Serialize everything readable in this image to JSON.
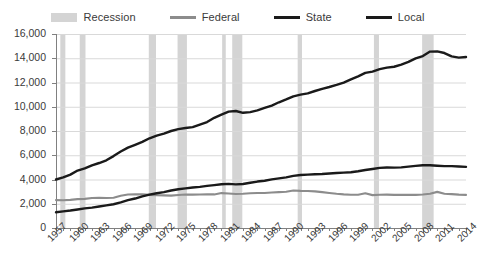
{
  "chart_data": {
    "type": "line",
    "title": "",
    "subtitle": "",
    "xlabel": "",
    "ylabel": "",
    "grid": true,
    "legend_position": "top-center",
    "units_note": "thousands of employees",
    "xlim": [
      1957,
      2014
    ],
    "ylim": [
      0,
      16000
    ],
    "ytick_step": 2000,
    "ytick_labels": [
      "16,000",
      "14,000",
      "12,000",
      "10,000",
      "8,000",
      "6,000",
      "4,000",
      "2,000",
      "0"
    ],
    "ytick_values": [
      16000,
      14000,
      12000,
      10000,
      8000,
      6000,
      4000,
      2000,
      0
    ],
    "xtick_labels": [
      "1957",
      "1960",
      "1963",
      "1966",
      "1969",
      "1972",
      "1975",
      "1978",
      "1981",
      "1984",
      "1987",
      "1990",
      "1993",
      "1996",
      "1999",
      "2002",
      "2005",
      "2008",
      "2011",
      "2014"
    ],
    "xtick_values": [
      1957,
      1960,
      1963,
      1966,
      1969,
      1972,
      1975,
      1978,
      1981,
      1984,
      1987,
      1990,
      1993,
      1996,
      1999,
      2002,
      2005,
      2008,
      2011,
      2014
    ],
    "x": [
      1957,
      1958,
      1959,
      1960,
      1961,
      1962,
      1963,
      1964,
      1965,
      1966,
      1967,
      1968,
      1969,
      1970,
      1971,
      1972,
      1973,
      1974,
      1975,
      1976,
      1977,
      1978,
      1979,
      1980,
      1981,
      1982,
      1983,
      1984,
      1985,
      1986,
      1987,
      1988,
      1989,
      1990,
      1991,
      1992,
      1993,
      1994,
      1995,
      1996,
      1997,
      1998,
      1999,
      2000,
      2001,
      2002,
      2003,
      2004,
      2005,
      2006,
      2007,
      2008,
      2009,
      2010,
      2011,
      2012,
      2013,
      2014
    ],
    "series": [
      {
        "name": "Federal",
        "color": "#8c8c8c",
        "values": [
          2300,
          2290,
          2320,
          2380,
          2400,
          2480,
          2490,
          2470,
          2500,
          2660,
          2760,
          2780,
          2770,
          2730,
          2700,
          2690,
          2670,
          2720,
          2760,
          2750,
          2760,
          2770,
          2770,
          2880,
          2840,
          2800,
          2820,
          2860,
          2890,
          2890,
          2930,
          2960,
          2990,
          3090,
          3060,
          3050,
          3020,
          2960,
          2890,
          2820,
          2770,
          2740,
          2740,
          2860,
          2710,
          2740,
          2750,
          2730,
          2730,
          2730,
          2730,
          2760,
          2830,
          2980,
          2820,
          2790,
          2750,
          2730
        ]
      },
      {
        "name": "State",
        "color": "#1a1a1a",
        "values": [
          1300,
          1370,
          1440,
          1530,
          1620,
          1680,
          1770,
          1870,
          1960,
          2120,
          2300,
          2430,
          2610,
          2750,
          2870,
          2960,
          3090,
          3200,
          3270,
          3340,
          3390,
          3470,
          3540,
          3610,
          3640,
          3600,
          3630,
          3730,
          3830,
          3900,
          4010,
          4090,
          4180,
          4300,
          4370,
          4400,
          4430,
          4450,
          4500,
          4540,
          4570,
          4600,
          4680,
          4780,
          4870,
          4960,
          4990,
          4980,
          5000,
          5060,
          5120,
          5180,
          5170,
          5130,
          5100,
          5100,
          5070,
          5040
        ]
      },
      {
        "name": "Local",
        "color": "#1a1a1a",
        "values": [
          4000,
          4170,
          4400,
          4740,
          4920,
          5170,
          5360,
          5580,
          5930,
          6310,
          6630,
          6860,
          7100,
          7400,
          7620,
          7790,
          8000,
          8150,
          8250,
          8320,
          8530,
          8740,
          9090,
          9350,
          9600,
          9650,
          9500,
          9560,
          9700,
          9900,
          10100,
          10370,
          10600,
          10860,
          11000,
          11100,
          11300,
          11480,
          11630,
          11800,
          11990,
          12260,
          12510,
          12790,
          12900,
          13100,
          13230,
          13300,
          13480,
          13700,
          13990,
          14180,
          14550,
          14570,
          14430,
          14150,
          14050,
          14100
        ]
      }
    ],
    "recession_bands": [
      {
        "label": "Recession",
        "start": 1957.6,
        "end": 1958.3
      },
      {
        "label": "Recession",
        "start": 1960.3,
        "end": 1961.1
      },
      {
        "label": "Recession",
        "start": 1969.9,
        "end": 1970.9
      },
      {
        "label": "Recession",
        "start": 1973.9,
        "end": 1975.2
      },
      {
        "label": "Recession",
        "start": 1980.1,
        "end": 1980.6
      },
      {
        "label": "Recession",
        "start": 1981.5,
        "end": 1982.9
      },
      {
        "label": "Recession",
        "start": 1990.6,
        "end": 1991.2
      },
      {
        "label": "Recession",
        "start": 2001.2,
        "end": 2001.9
      },
      {
        "label": "Recession",
        "start": 2007.9,
        "end": 2009.5
      }
    ]
  },
  "legend": {
    "items": [
      {
        "label": "Recession",
        "swatch": "band",
        "color": "#d4d4d4"
      },
      {
        "label": "Federal",
        "swatch": "line",
        "color": "#8c8c8c"
      },
      {
        "label": "State",
        "swatch": "line",
        "color": "#1a1a1a"
      },
      {
        "label": "Local",
        "swatch": "line",
        "color": "#1a1a1a"
      }
    ]
  },
  "colors": {
    "background": "#ffffff",
    "grid": "#d9d9d9",
    "axis": "#808080",
    "text": "#3a3a3a",
    "recession": "#d4d4d4",
    "federal": "#8c8c8c",
    "state": "#1a1a1a",
    "local": "#1a1a1a"
  }
}
